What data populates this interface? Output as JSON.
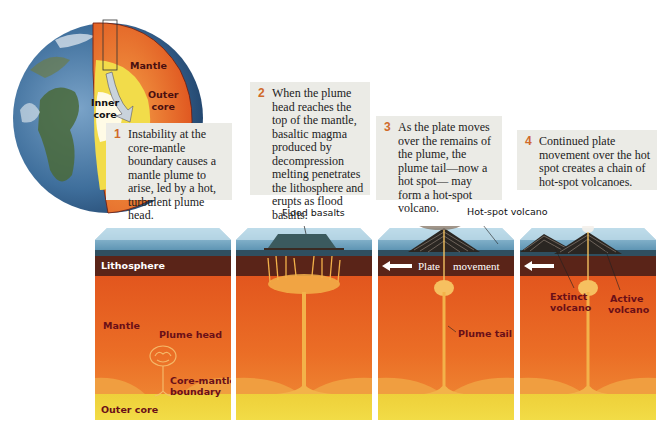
{
  "globe": {
    "labels": {
      "mantle": "Mantle",
      "outer_core": "Outer\ncore",
      "inner_core": "Inner\ncore"
    }
  },
  "steps": [
    {
      "number": "1",
      "text": "Instability at the core-mantle boundary causes a mantle plume to arise, led by a hot, turbulent plume head."
    },
    {
      "number": "2",
      "text": "When the plume head reaches the top of the mantle, basaltic magma produced by decompression melting penetrates the lithosphere and erupts as flood basalts."
    },
    {
      "number": "3",
      "text": "As the plate moves over the remains of the plume, the plume tail—now a hot spot— may form a hot-spot volcano."
    },
    {
      "number": "4",
      "text": "Continued plate movement over the hot spot creates a chain of hot-spot volcanoes."
    }
  ],
  "blocks": [
    {
      "labels": {
        "lithosphere": "Lithosphere",
        "mantle": "Mantle",
        "plume_head": "Plume head",
        "core_mantle_boundary_1": "Core-mantle",
        "core_mantle_boundary_2": "boundary",
        "outer_core": "Outer core"
      }
    },
    {
      "labels": {
        "flood_basalts": "Flood basalts"
      }
    },
    {
      "labels": {
        "hot_spot_volcano": "Hot-spot volcano",
        "plate": "Plate",
        "movement": "movement",
        "plume_tail": "Plume tail"
      }
    },
    {
      "labels": {
        "extinct_1": "Extinct",
        "extinct_2": "volcano",
        "active_1": "Active",
        "active_2": "volcano"
      }
    }
  ],
  "colors": {
    "ocean": "#5b98b8",
    "lithosphere": "#5a2418",
    "mantle_top": "#e0501c",
    "mantle_bottom": "#f08a30",
    "outer_core": "#efd536",
    "plume": "#f3b24a",
    "label_dark": "#6a0f18",
    "step_number": "#d06a2a",
    "caption_bg": "#ebebe6"
  }
}
